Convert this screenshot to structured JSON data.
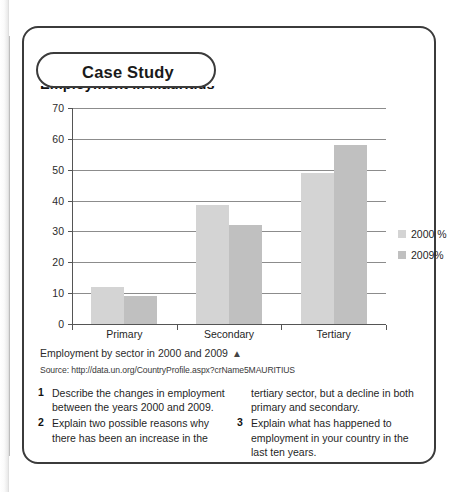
{
  "tab": {
    "label": "Case Study"
  },
  "chart_title": "Employment in Mauritius",
  "chart_data": {
    "type": "bar",
    "title": "Employment in Mauritius",
    "xlabel": "",
    "ylabel": "",
    "ylim": [
      0,
      70
    ],
    "ytick_step": 10,
    "yticks": [
      0,
      10,
      20,
      30,
      40,
      50,
      60,
      70
    ],
    "grid": true,
    "legend_position": "right",
    "categories": [
      "Primary",
      "Secondary",
      "Tertiary"
    ],
    "series": [
      {
        "name": "2000 %",
        "color": "#d4d4d4",
        "values": [
          12,
          38.5,
          49
        ]
      },
      {
        "name": "2009%",
        "color": "#c0c0c0",
        "values": [
          9,
          32,
          58
        ]
      }
    ]
  },
  "caption": {
    "text": "Employment by sector in 2000 and 2009",
    "arrow": "▲"
  },
  "source": "Source: http://data.un.org/CountryProfile.aspx?crName5MAURITIUS",
  "questions": {
    "left": [
      {
        "num": "1",
        "text": "Describe the changes in employment between the years 2000 and 2009."
      },
      {
        "num": "2",
        "text": "Explain two possible reasons why there has been an increase in the"
      }
    ],
    "right_continuation": "tertiary sector, but a decline in both primary and secondary.",
    "right": [
      {
        "num": "3",
        "text": "Explain what has happened to employment in your country in the last ten years."
      }
    ]
  }
}
